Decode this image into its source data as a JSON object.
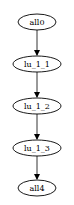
{
  "diagram": {
    "type": "directed-graph",
    "nodes": [
      {
        "id": "all0",
        "label": "all0",
        "cx": 37,
        "cy": 22,
        "rx": 19,
        "ry": 8
      },
      {
        "id": "lu_1_1",
        "label": "lu_1_1",
        "cx": 37,
        "cy": 64,
        "rx": 24,
        "ry": 8
      },
      {
        "id": "lu_1_2",
        "label": "lu_1_2",
        "cx": 37,
        "cy": 106,
        "rx": 24,
        "ry": 8
      },
      {
        "id": "lu_1_3",
        "label": "lu_1_3",
        "cx": 37,
        "cy": 148,
        "rx": 24,
        "ry": 8
      },
      {
        "id": "all4",
        "label": "all4",
        "cx": 37,
        "cy": 188,
        "rx": 19,
        "ry": 8
      }
    ],
    "edges": [
      {
        "from": "all0",
        "to": "lu_1_1"
      },
      {
        "from": "lu_1_1",
        "to": "lu_1_2"
      },
      {
        "from": "lu_1_2",
        "to": "lu_1_3"
      },
      {
        "from": "lu_1_3",
        "to": "all4"
      }
    ],
    "colors": {
      "stroke": "#000000",
      "background": "#ffffff",
      "text": "#000000"
    }
  }
}
